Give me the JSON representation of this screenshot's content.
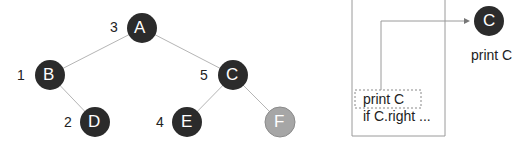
{
  "tree": {
    "nodes": [
      {
        "id": "A",
        "label": "A",
        "order": "3",
        "x": 142,
        "y": 28,
        "state": "dark"
      },
      {
        "id": "B",
        "label": "B",
        "order": "1",
        "x": 50,
        "y": 75,
        "state": "dark"
      },
      {
        "id": "C",
        "label": "C",
        "order": "5",
        "x": 233,
        "y": 75,
        "state": "dark"
      },
      {
        "id": "D",
        "label": "D",
        "order": "2",
        "x": 95,
        "y": 122,
        "state": "dark"
      },
      {
        "id": "E",
        "label": "E",
        "order": "4",
        "x": 187,
        "y": 122,
        "state": "dark"
      },
      {
        "id": "F",
        "label": "F",
        "order": "",
        "x": 280,
        "y": 122,
        "state": "light"
      }
    ],
    "edges": [
      [
        "A",
        "B"
      ],
      [
        "A",
        "C"
      ],
      [
        "B",
        "D"
      ],
      [
        "C",
        "E"
      ],
      [
        "C",
        "F"
      ]
    ]
  },
  "stack": {
    "frame_line1": "print C",
    "frame_line2": "if C.right ..."
  },
  "output": {
    "node_label": "C",
    "caption": "print C"
  },
  "colors": {
    "dark": "#2b2b2b",
    "light": "#a6a6a6",
    "edge": "#b5b5b5"
  }
}
